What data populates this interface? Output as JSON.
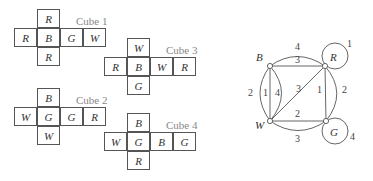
{
  "cubes": [
    {
      "label": "Cube 1",
      "top": "R",
      "row": [
        "R",
        "B",
        "G",
        "W"
      ],
      "bottom": "R"
    },
    {
      "label": "Cube 2",
      "top": "B",
      "row": [
        "W",
        "G",
        "G",
        "R"
      ],
      "bottom": "W"
    },
    {
      "label": "Cube 3",
      "top": "W",
      "row": [
        "R",
        "B",
        "W",
        "R"
      ],
      "bottom": "G"
    },
    {
      "label": "Cube 4",
      "top": "B",
      "row": [
        "W",
        "G",
        "B",
        "G"
      ],
      "bottom": "R"
    }
  ],
  "graph": {
    "nodes": {
      "B": "B",
      "R": "R",
      "W": "W",
      "G": "G"
    },
    "edge_labels": {
      "BR_arc_top": "4",
      "BR_straight": "3",
      "R_loop": "1",
      "BW_arc_left": "2",
      "BW_straight": "1",
      "BW_inner_arc": "4",
      "WR_diagonal": "3",
      "RG_straight": "1",
      "RG_arc_right": "2",
      "WG_straight": "2",
      "WG_arc_bottom": "3",
      "G_loop": "4"
    }
  }
}
